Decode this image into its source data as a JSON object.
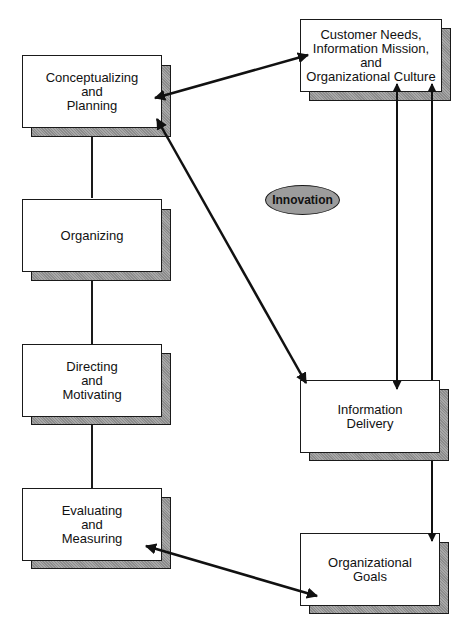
{
  "diagram": {
    "boxes": {
      "conceptualizing": {
        "label": "Conceptualizing\nand\nPlanning"
      },
      "organizing": {
        "label": "Organizing"
      },
      "directing": {
        "label": "Directing\nand\nMotivating"
      },
      "evaluating": {
        "label": "Evaluating\nand\nMeasuring"
      },
      "customer_needs": {
        "label": "Customer Needs,\nInformation Mission,\nand\nOrganizational Culture"
      },
      "information_delivery": {
        "label": "Information\nDelivery"
      },
      "organizational_goals": {
        "label": "Organizational\nGoals"
      }
    },
    "center_label": {
      "label": "Innovation"
    },
    "connections": [
      {
        "from": "conceptualizing",
        "to": "organizing",
        "type": "line"
      },
      {
        "from": "organizing",
        "to": "directing",
        "type": "line"
      },
      {
        "from": "directing",
        "to": "evaluating",
        "type": "line"
      },
      {
        "from": "conceptualizing",
        "to": "customer_needs",
        "type": "double-arrow"
      },
      {
        "from": "conceptualizing",
        "to": "information_delivery",
        "type": "double-arrow"
      },
      {
        "from": "customer_needs",
        "to": "information_delivery",
        "type": "double-arrow"
      },
      {
        "from": "information_delivery",
        "to": "customer_needs",
        "type": "arrow"
      },
      {
        "from": "information_delivery",
        "to": "organizational_goals",
        "type": "arrow"
      },
      {
        "from": "evaluating",
        "to": "organizational_goals",
        "type": "double-arrow"
      }
    ]
  }
}
